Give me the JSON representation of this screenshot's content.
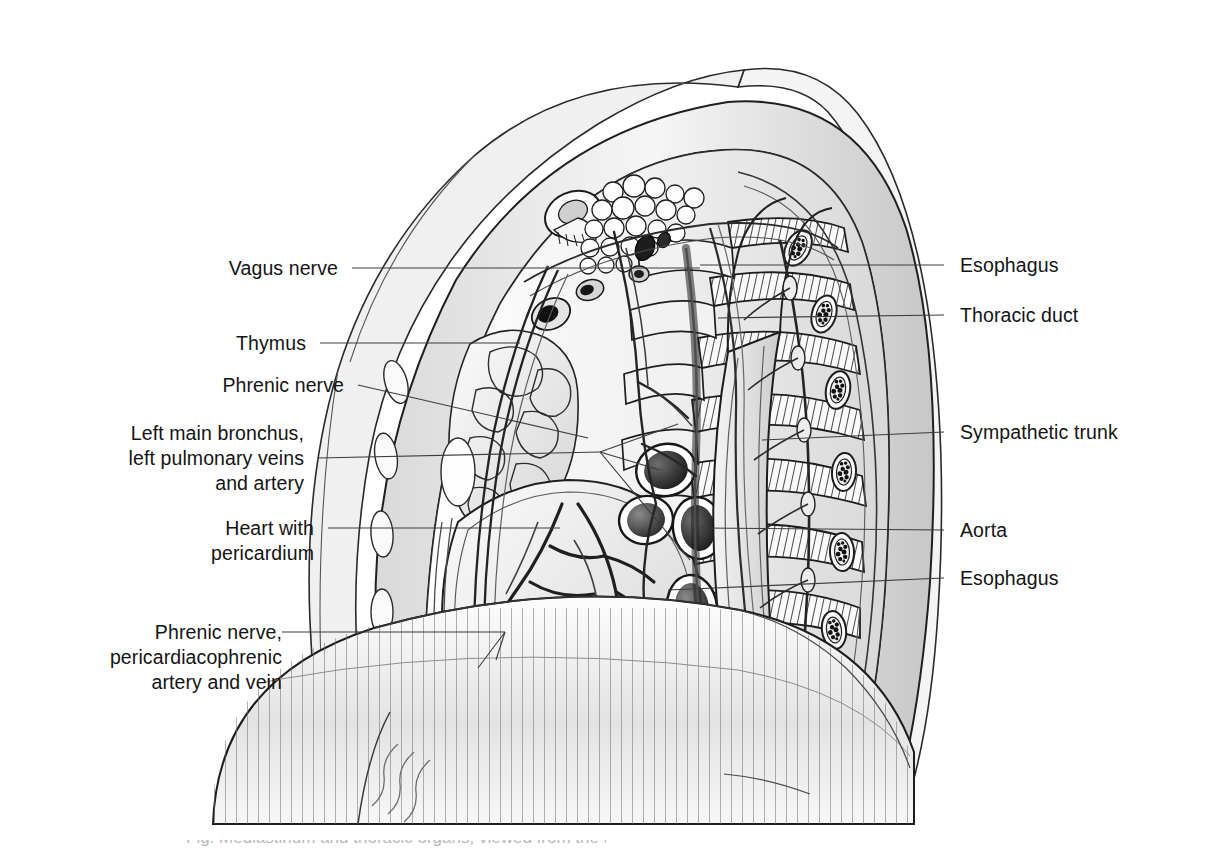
{
  "figure": {
    "type": "anatomical-illustration",
    "background_color": "#ffffff",
    "frame_color": "#9a9a9a",
    "ink_color": "#141414",
    "leader_color": "#3c3c3c",
    "cropped_caption": "Fig. Mediastinum and thoracic organs, viewed from the left"
  },
  "labels_left": [
    {
      "id": "vagus-nerve",
      "text": "Vagus nerve"
    },
    {
      "id": "thymus",
      "text": "Thymus"
    },
    {
      "id": "phrenic-nerve",
      "text": "Phrenic nerve"
    },
    {
      "id": "left-main-bronchus",
      "text": "Left main bronchus,\nleft pulmonary veins\nand artery"
    },
    {
      "id": "heart-pericardium",
      "text": "Heart with\npericardium"
    },
    {
      "id": "phrenic-pericardiacophrenic",
      "text": "Phrenic nerve,\npericardiacophrenic\nartery and vein"
    }
  ],
  "labels_right": [
    {
      "id": "esophagus-upper",
      "text": "Esophagus"
    },
    {
      "id": "thoracic-duct",
      "text": "Thoracic duct"
    },
    {
      "id": "sympathetic-trunk",
      "text": "Sympathetic trunk"
    },
    {
      "id": "aorta",
      "text": "Aorta"
    },
    {
      "id": "esophagus-lower",
      "text": "Esophagus"
    }
  ],
  "structures": [
    "clavicle cross-section",
    "subclavian vessels",
    "adipose tissue / lymph nodes",
    "thymus lobules",
    "pericardium",
    "left main bronchus",
    "left pulmonary artery",
    "left pulmonary veins",
    "descending aorta",
    "esophagus",
    "thoracic duct",
    "sympathetic trunk",
    "ribs with intercostal muscles",
    "diaphragm",
    "vertebral bodies"
  ]
}
